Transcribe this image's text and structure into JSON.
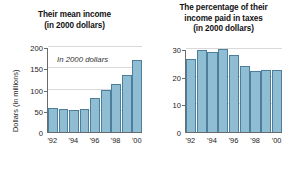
{
  "chart_data": [
    {
      "type": "bar",
      "panel": "left",
      "title": "Their mean income\n(in 2000 dollars)",
      "title_line1": "Their mean income",
      "title_line2": "(in 2000 dollars)",
      "xlabel": "",
      "ylabel": "Dollars (in millions)",
      "annotation": "In 2000 dollars",
      "categories": [
        "'92",
        "'93",
        "'94",
        "'95",
        "'96",
        "'97",
        "'98",
        "'99",
        "'00"
      ],
      "tick_labels": [
        "'92",
        "'94",
        "'96",
        "'98",
        "'00"
      ],
      "values": [
        57,
        54,
        51,
        55,
        79,
        98,
        114,
        135,
        170
      ],
      "ylim": [
        0,
        200
      ],
      "yticks": [
        0,
        50,
        100,
        150,
        200
      ],
      "ytick_labels": [
        "0",
        "50",
        "100",
        "150",
        "200"
      ],
      "grid": true,
      "legend": "none"
    },
    {
      "type": "bar",
      "panel": "right",
      "title": "The percentage of their\nincome paid in taxes\n(in 2000 dollars)",
      "title_line1": "The percentage of their",
      "title_line2": "income paid in taxes",
      "title_line3": "(in 2000 dollars)",
      "xlabel": "",
      "ylabel": "Percentage",
      "categories": [
        "'92",
        "'93",
        "'94",
        "'95",
        "'96",
        "'97",
        "'98",
        "'99",
        "'00"
      ],
      "tick_labels": [
        "'92",
        "'94",
        "'96",
        "'98",
        "'00"
      ],
      "values": [
        26.5,
        29.5,
        29,
        30,
        28,
        24,
        22,
        22.3,
        22.3
      ],
      "ylim": [
        0,
        30
      ],
      "yticks": [
        0,
        10,
        20,
        30
      ],
      "ytick_labels": [
        "0",
        "10",
        "20",
        "30"
      ],
      "grid": true,
      "legend": "none"
    }
  ],
  "style": {
    "bar_fill": "#8fbdd4",
    "bar_edge": "#4d7e9b",
    "grid_color": "#d9d9d9",
    "axis_color": "#6b6b6b",
    "text_color": "#1b1b1b",
    "background": "#ffffff"
  }
}
